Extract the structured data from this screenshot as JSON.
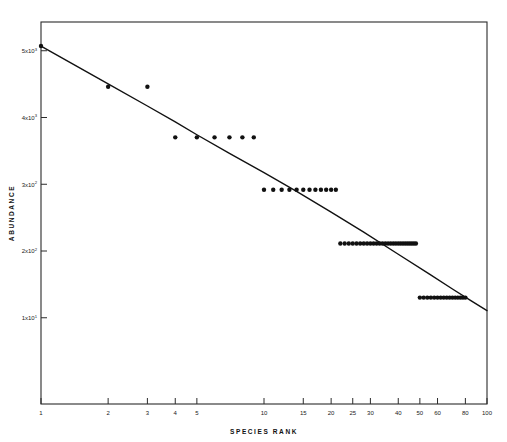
{
  "chart_data": {
    "type": "scatter",
    "title": "",
    "xlabel": "SPECIES   RANK",
    "ylabel": "ABUNDANCE",
    "xscale": "log",
    "yscale": "log",
    "xlim": [
      1,
      100
    ],
    "ylim": [
      1,
      10000
    ],
    "grid": false,
    "legend": null,
    "xticks": [
      1,
      2,
      3,
      4,
      5,
      10,
      15,
      20,
      25,
      30,
      40,
      50,
      60,
      80,
      100
    ],
    "xtick_labels": [
      "1",
      "2",
      "3",
      "4",
      "5",
      "10",
      "15",
      "20",
      "25",
      "30",
      "40",
      "50",
      "60",
      "80",
      "100"
    ],
    "yticks": [
      5000,
      1000,
      200,
      40,
      8
    ],
    "ytick_labels": [
      "5x10",
      "4x10",
      "3x10",
      "2x10",
      "1x10"
    ],
    "ytick_exponents": [
      "3",
      "3",
      "2",
      "2",
      "1"
    ],
    "series": [
      {
        "name": "observed abundance",
        "marker": "filled-circle",
        "marker_color": "#111111",
        "points": [
          {
            "rank": 1,
            "abundance": 5600
          },
          {
            "rank": 2,
            "abundance": 2100
          },
          {
            "rank": 3,
            "abundance": 2100
          },
          {
            "rank": 4,
            "abundance": 620
          },
          {
            "rank": 5,
            "abundance": 620
          },
          {
            "rank": 6,
            "abundance": 620
          },
          {
            "rank": 7,
            "abundance": 620
          },
          {
            "rank": 8,
            "abundance": 620
          },
          {
            "rank": 9,
            "abundance": 620
          },
          {
            "rank": 10,
            "abundance": 175
          },
          {
            "rank": 11,
            "abundance": 175
          },
          {
            "rank": 12,
            "abundance": 175
          },
          {
            "rank": 13,
            "abundance": 175
          },
          {
            "rank": 14,
            "abundance": 175
          },
          {
            "rank": 15,
            "abundance": 175
          },
          {
            "rank": 16,
            "abundance": 175
          },
          {
            "rank": 17,
            "abundance": 175
          },
          {
            "rank": 18,
            "abundance": 175
          },
          {
            "rank": 19,
            "abundance": 175
          },
          {
            "rank": 20,
            "abundance": 175
          },
          {
            "rank": 21,
            "abundance": 175
          },
          {
            "rank": 22,
            "abundance": 48
          },
          {
            "rank": 23,
            "abundance": 48
          },
          {
            "rank": 24,
            "abundance": 48
          },
          {
            "rank": 25,
            "abundance": 48
          },
          {
            "rank": 26,
            "abundance": 48
          },
          {
            "rank": 27,
            "abundance": 48
          },
          {
            "rank": 28,
            "abundance": 48
          },
          {
            "rank": 29,
            "abundance": 48
          },
          {
            "rank": 30,
            "abundance": 48
          },
          {
            "rank": 31,
            "abundance": 48
          },
          {
            "rank": 32,
            "abundance": 48
          },
          {
            "rank": 33,
            "abundance": 48
          },
          {
            "rank": 34,
            "abundance": 48
          },
          {
            "rank": 35,
            "abundance": 48
          },
          {
            "rank": 36,
            "abundance": 48
          },
          {
            "rank": 37,
            "abundance": 48
          },
          {
            "rank": 38,
            "abundance": 48
          },
          {
            "rank": 39,
            "abundance": 48
          },
          {
            "rank": 40,
            "abundance": 48
          },
          {
            "rank": 41,
            "abundance": 48
          },
          {
            "rank": 42,
            "abundance": 48
          },
          {
            "rank": 43,
            "abundance": 48
          },
          {
            "rank": 44,
            "abundance": 48
          },
          {
            "rank": 45,
            "abundance": 48
          },
          {
            "rank": 46,
            "abundance": 48
          },
          {
            "rank": 47,
            "abundance": 48
          },
          {
            "rank": 48,
            "abundance": 48
          },
          {
            "rank": 50,
            "abundance": 13
          },
          {
            "rank": 52,
            "abundance": 13
          },
          {
            "rank": 54,
            "abundance": 13
          },
          {
            "rank": 56,
            "abundance": 13
          },
          {
            "rank": 58,
            "abundance": 13
          },
          {
            "rank": 60,
            "abundance": 13
          },
          {
            "rank": 62,
            "abundance": 13
          },
          {
            "rank": 64,
            "abundance": 13
          },
          {
            "rank": 66,
            "abundance": 13
          },
          {
            "rank": 68,
            "abundance": 13
          },
          {
            "rank": 70,
            "abundance": 13
          },
          {
            "rank": 72,
            "abundance": 13
          },
          {
            "rank": 74,
            "abundance": 13
          },
          {
            "rank": 76,
            "abundance": 13
          },
          {
            "rank": 78,
            "abundance": 13
          },
          {
            "rank": 80,
            "abundance": 13
          }
        ]
      }
    ],
    "fitted_curve": {
      "name": "fitted rank-abundance curve",
      "color": "#111111",
      "points": [
        {
          "rank": 1,
          "abundance": 5600
        },
        {
          "rank": 2,
          "abundance": 2250
        },
        {
          "rank": 3,
          "abundance": 1320
        },
        {
          "rank": 4,
          "abundance": 900
        },
        {
          "rank": 5,
          "abundance": 660
        },
        {
          "rank": 7,
          "abundance": 420
        },
        {
          "rank": 10,
          "abundance": 265
        },
        {
          "rank": 14,
          "abundance": 168
        },
        {
          "rank": 20,
          "abundance": 102
        },
        {
          "rank": 28,
          "abundance": 63
        },
        {
          "rank": 40,
          "abundance": 37
        },
        {
          "rank": 55,
          "abundance": 23
        },
        {
          "rank": 70,
          "abundance": 16
        },
        {
          "rank": 85,
          "abundance": 12
        },
        {
          "rank": 100,
          "abundance": 9.5
        }
      ]
    }
  }
}
